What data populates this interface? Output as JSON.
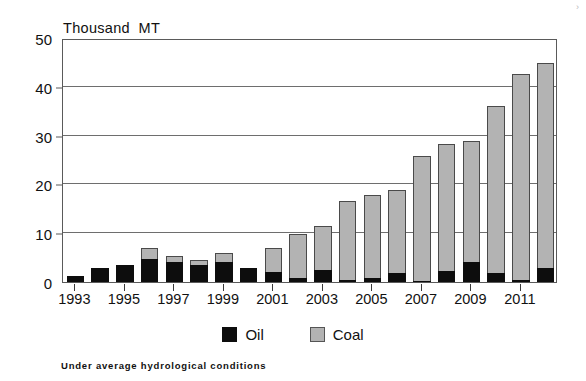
{
  "chart_data": {
    "type": "bar",
    "subtype": "stacked-bar",
    "title": "",
    "unit_label": "Thousand  MT",
    "xlabel": "",
    "ylabel": "Thousand MT",
    "ylim": [
      0,
      50
    ],
    "yticks": [
      0,
      10,
      20,
      30,
      40,
      50
    ],
    "ytick_labels": [
      "0",
      "10",
      "20",
      "30",
      "40",
      "50"
    ],
    "grid": true,
    "legend_position": "bottom-center",
    "footnote": "Under average hydrological conditions",
    "categories": [
      "1993",
      "1994",
      "1995",
      "1996",
      "1997",
      "1998",
      "1999",
      "2000",
      "2001",
      "2002",
      "2003",
      "2004",
      "2005",
      "2006",
      "2007",
      "2008",
      "2009",
      "2010",
      "2011",
      "2012"
    ],
    "xtick_labels": [
      "1993",
      "1995",
      "1997",
      "1999",
      "2001",
      "2003",
      "2005",
      "2007",
      "2009",
      "2011"
    ],
    "xtick_categories": [
      "1993",
      "1995",
      "1997",
      "1999",
      "2001",
      "2003",
      "2005",
      "2007",
      "2009",
      "2011"
    ],
    "series": [
      {
        "name": "Oil",
        "color": "#0d0d0d",
        "values": [
          1.2,
          2.9,
          3.4,
          4.8,
          4.0,
          3.5,
          4.1,
          2.9,
          2.0,
          0.9,
          2.5,
          0.4,
          0.9,
          1.9,
          0.3,
          2.3,
          4.1,
          1.9,
          0.5,
          2.9
        ]
      },
      {
        "name": "Coal",
        "color": "#b3b3b3",
        "values": [
          0.0,
          0.0,
          0.0,
          2.2,
          1.4,
          1.0,
          1.8,
          0.0,
          4.9,
          8.9,
          8.9,
          16.3,
          17.0,
          17.0,
          25.5,
          26.0,
          24.8,
          34.1,
          42.1,
          41.9
        ]
      }
    ],
    "totals": [
      1.2,
      2.9,
      3.4,
      7.0,
      5.4,
      4.5,
      5.9,
      2.9,
      6.9,
      9.8,
      11.4,
      16.7,
      17.9,
      18.9,
      25.8,
      28.3,
      28.9,
      36.0,
      42.6,
      44.8
    ]
  },
  "legend": {
    "items": [
      {
        "label": "Oil",
        "swatch": "black-square-swatch"
      },
      {
        "label": "Coal",
        "swatch": "gray-square-swatch"
      }
    ]
  }
}
